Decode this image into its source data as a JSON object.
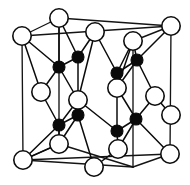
{
  "figure": {
    "type": "crystal-structure-diagram",
    "canvas": {
      "width": 190,
      "height": 185
    },
    "colors": {
      "background": "#ffffff",
      "open_atom_fill": "#ffffff",
      "open_atom_stroke": "#0d0d0d",
      "filled_atom_fill": "#0a0a0a",
      "bond_stroke": "#0b0b0b",
      "cube_edge_stroke": "#141414"
    },
    "legend": {
      "open_atom_label": "open circle atom",
      "filled_atom_label": "filled circle atom"
    }
  },
  "lattice": {
    "open_atom_radius": 9.2,
    "filled_atom_radius": 6.0,
    "open_atoms": [
      {
        "id": "o1",
        "name": "corner-back-top-left",
        "x": 22,
        "y": 36
      },
      {
        "id": "o2",
        "name": "corner-top-back-mid",
        "x": 59,
        "y": 18
      },
      {
        "id": "o3",
        "name": "face-top-front-left",
        "x": 95,
        "y": 32
      },
      {
        "id": "o4",
        "name": "corner-back-top-right",
        "x": 171,
        "y": 26
      },
      {
        "id": "o5",
        "name": "face-top-right",
        "x": 133,
        "y": 41
      },
      {
        "id": "o6",
        "name": "face-left-mid",
        "x": 41,
        "y": 92
      },
      {
        "id": "o7",
        "name": "face-center-front",
        "x": 78,
        "y": 100
      },
      {
        "id": "o8",
        "name": "face-right-mid",
        "x": 155,
        "y": 96
      },
      {
        "id": "o9",
        "name": "face-interior-right",
        "x": 117,
        "y": 88
      },
      {
        "id": "o10",
        "name": "face-bottom-left-mid",
        "x": 59,
        "y": 144
      },
      {
        "id": "o11",
        "name": "face-bottom-center",
        "x": 118,
        "y": 149
      },
      {
        "id": "o12",
        "name": "corner-front-bottom-left",
        "x": 23,
        "y": 160
      },
      {
        "id": "o13",
        "name": "corner-front-bottom-mid",
        "x": 94,
        "y": 167
      },
      {
        "id": "o14",
        "name": "corner-front-bottom-right",
        "x": 170,
        "y": 154
      },
      {
        "id": "o15",
        "name": "corner-back-bottom-right",
        "x": 171,
        "y": 115
      }
    ],
    "filled_atoms": [
      {
        "id": "f1",
        "name": "tetra-upper-left-inner",
        "x": 78,
        "y": 57
      },
      {
        "id": "f2",
        "name": "tetra-upper-left-outer",
        "x": 59,
        "y": 67
      },
      {
        "id": "f3",
        "name": "tetra-upper-right-inner",
        "x": 137,
        "y": 60
      },
      {
        "id": "f4",
        "name": "tetra-upper-right-outer",
        "x": 117,
        "y": 73
      },
      {
        "id": "f5",
        "name": "tetra-lower-left-inner",
        "x": 78,
        "y": 115
      },
      {
        "id": "f6",
        "name": "tetra-lower-left-outer",
        "x": 59,
        "y": 125
      },
      {
        "id": "f7",
        "name": "tetra-lower-right-inner",
        "x": 136,
        "y": 119
      },
      {
        "id": "f8",
        "name": "tetra-lower-right-outer",
        "x": 117,
        "y": 131
      }
    ],
    "cube_vertices": {
      "back_top_left": {
        "x": 22,
        "y": 36
      },
      "back_top_right": {
        "x": 171,
        "y": 26
      },
      "front_top_left": {
        "x": 59,
        "y": 18
      },
      "back_bottom_left": {
        "x": 22,
        "y": 128
      },
      "back_bottom_right": {
        "x": 171,
        "y": 115
      },
      "front_bottom_left": {
        "x": 23,
        "y": 160
      },
      "front_bottom_right": {
        "x": 170,
        "y": 154
      },
      "front_top_right": {
        "x": 133,
        "y": 41
      }
    },
    "cube_edges": [
      {
        "name": "edge-back-top",
        "x1": 22,
        "y1": 36,
        "x2": 171,
        "y2": 26
      },
      {
        "name": "edge-back-left",
        "x1": 22,
        "y1": 36,
        "x2": 23,
        "y2": 160
      },
      {
        "name": "edge-back-right",
        "x1": 171,
        "y1": 26,
        "x2": 170,
        "y2": 154
      },
      {
        "name": "edge-front-bottom",
        "x1": 23,
        "y1": 160,
        "x2": 170,
        "y2": 154
      },
      {
        "name": "edge-top-left-diag",
        "x1": 22,
        "y1": 36,
        "x2": 59,
        "y2": 18
      },
      {
        "name": "edge-top-front",
        "x1": 59,
        "y1": 18,
        "x2": 171,
        "y2": 26
      },
      {
        "name": "edge-left-vert-in",
        "x1": 59,
        "y1": 18,
        "x2": 59,
        "y2": 144
      },
      {
        "name": "edge-bottom-diag",
        "x1": 59,
        "y1": 144,
        "x2": 23,
        "y2": 160
      },
      {
        "name": "edge-right-vert-in",
        "x1": 133,
        "y1": 41,
        "x2": 133,
        "y2": 167
      },
      {
        "name": "edge-bottom-front",
        "x1": 23,
        "y1": 160,
        "x2": 133,
        "y2": 167
      },
      {
        "name": "edge-right-diag-top",
        "x1": 133,
        "y1": 41,
        "x2": 171,
        "y2": 26
      },
      {
        "name": "edge-right-diag-bot",
        "x1": 133,
        "y1": 167,
        "x2": 170,
        "y2": 154
      },
      {
        "name": "edge-inner-vert-mid",
        "x1": 59,
        "y1": 144,
        "x2": 133,
        "y2": 167
      }
    ],
    "bonds": [
      {
        "from": "f1",
        "to": "o2",
        "x1": 78,
        "y1": 57,
        "x2": 59,
        "y2": 18
      },
      {
        "from": "f1",
        "to": "o3",
        "x1": 78,
        "y1": 57,
        "x2": 95,
        "y2": 32
      },
      {
        "from": "f1",
        "to": "o7",
        "x1": 78,
        "y1": 57,
        "x2": 78,
        "y2": 100
      },
      {
        "from": "f1",
        "to": "f2",
        "x1": 78,
        "y1": 57,
        "x2": 59,
        "y2": 67
      },
      {
        "from": "f2",
        "to": "o1",
        "x1": 59,
        "y1": 67,
        "x2": 22,
        "y2": 36
      },
      {
        "from": "f2",
        "to": "o2",
        "x1": 59,
        "y1": 67,
        "x2": 59,
        "y2": 18
      },
      {
        "from": "f2",
        "to": "o6",
        "x1": 59,
        "y1": 67,
        "x2": 41,
        "y2": 92
      },
      {
        "from": "f2",
        "to": "o7",
        "x1": 59,
        "y1": 67,
        "x2": 78,
        "y2": 100
      },
      {
        "from": "f3",
        "to": "o5",
        "x1": 137,
        "y1": 60,
        "x2": 133,
        "y2": 41
      },
      {
        "from": "f3",
        "to": "o4",
        "x1": 137,
        "y1": 60,
        "x2": 171,
        "y2": 26
      },
      {
        "from": "f3",
        "to": "o9",
        "x1": 137,
        "y1": 60,
        "x2": 117,
        "y2": 88
      },
      {
        "from": "f3",
        "to": "o8",
        "x1": 137,
        "y1": 60,
        "x2": 155,
        "y2": 96
      },
      {
        "from": "f4",
        "to": "o3",
        "x1": 117,
        "y1": 73,
        "x2": 95,
        "y2": 32
      },
      {
        "from": "f4",
        "to": "o5",
        "x1": 117,
        "y1": 73,
        "x2": 133,
        "y2": 41
      },
      {
        "from": "f4",
        "to": "o9",
        "x1": 117,
        "y1": 73,
        "x2": 117,
        "y2": 88
      },
      {
        "from": "f4",
        "to": "f3",
        "x1": 117,
        "y1": 73,
        "x2": 137,
        "y2": 60
      },
      {
        "from": "f5",
        "to": "o7",
        "x1": 78,
        "y1": 115,
        "x2": 78,
        "y2": 100
      },
      {
        "from": "f5",
        "to": "o10",
        "x1": 78,
        "y1": 115,
        "x2": 59,
        "y2": 144
      },
      {
        "from": "f5",
        "to": "o13",
        "x1": 78,
        "y1": 115,
        "x2": 94,
        "y2": 167
      },
      {
        "from": "f5",
        "to": "f6",
        "x1": 78,
        "y1": 115,
        "x2": 59,
        "y2": 125
      },
      {
        "from": "f6",
        "to": "o6",
        "x1": 59,
        "y1": 125,
        "x2": 41,
        "y2": 92
      },
      {
        "from": "f6",
        "to": "o10",
        "x1": 59,
        "y1": 125,
        "x2": 59,
        "y2": 144
      },
      {
        "from": "f6",
        "to": "o12",
        "x1": 59,
        "y1": 125,
        "x2": 23,
        "y2": 160
      },
      {
        "from": "f6",
        "to": "o7",
        "x1": 59,
        "y1": 125,
        "x2": 78,
        "y2": 100
      },
      {
        "from": "f7",
        "to": "o9",
        "x1": 136,
        "y1": 119,
        "x2": 117,
        "y2": 88
      },
      {
        "from": "f7",
        "to": "o8",
        "x1": 136,
        "y1": 119,
        "x2": 155,
        "y2": 96
      },
      {
        "from": "f7",
        "to": "o11",
        "x1": 136,
        "y1": 119,
        "x2": 118,
        "y2": 149
      },
      {
        "from": "f7",
        "to": "o14",
        "x1": 136,
        "y1": 119,
        "x2": 170,
        "y2": 154
      },
      {
        "from": "f8",
        "to": "o7",
        "x1": 117,
        "y1": 131,
        "x2": 78,
        "y2": 100
      },
      {
        "from": "f8",
        "to": "o9",
        "x1": 117,
        "y1": 131,
        "x2": 117,
        "y2": 88
      },
      {
        "from": "f8",
        "to": "o11",
        "x1": 117,
        "y1": 131,
        "x2": 118,
        "y2": 149
      },
      {
        "from": "f8",
        "to": "f7",
        "x1": 117,
        "y1": 131,
        "x2": 136,
        "y2": 119
      },
      {
        "from": "o7",
        "to": "o3",
        "x1": 78,
        "y1": 100,
        "x2": 95,
        "y2": 32
      },
      {
        "from": "o6",
        "to": "o1",
        "x1": 41,
        "y1": 92,
        "x2": 22,
        "y2": 36
      },
      {
        "from": "o11",
        "to": "o13",
        "x1": 118,
        "y1": 149,
        "x2": 94,
        "y2": 167
      },
      {
        "from": "o10",
        "to": "o12",
        "x1": 59,
        "y1": 144,
        "x2": 23,
        "y2": 160
      },
      {
        "from": "o8",
        "to": "o15",
        "x1": 155,
        "y1": 96,
        "x2": 171,
        "y2": 115
      },
      {
        "from": "o9",
        "to": "o5",
        "x1": 117,
        "y1": 88,
        "x2": 133,
        "y2": 41
      }
    ]
  }
}
